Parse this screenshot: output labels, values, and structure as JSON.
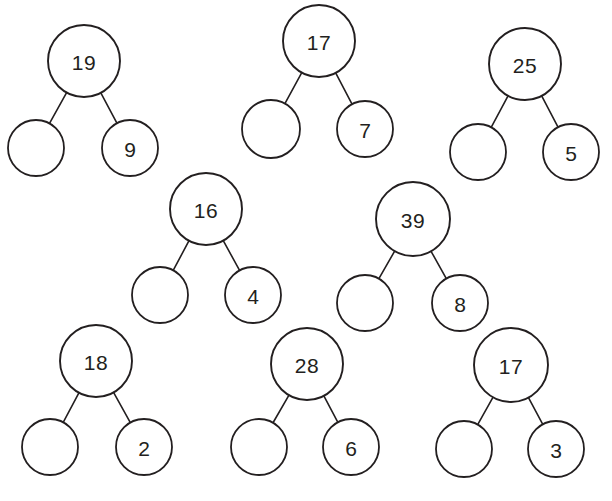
{
  "page": {
    "background_color": "#ffffff",
    "stroke_color": "#231f20",
    "text_color": "#231f20",
    "width": 612,
    "height": 501
  },
  "bonds": [
    {
      "id": "bond-1",
      "whole": "19",
      "left_part": "",
      "right_part": "9",
      "parent": {
        "cx": 84,
        "cy": 61,
        "r": 36
      },
      "left_child": {
        "cx": 36,
        "cy": 148,
        "r": 28
      },
      "right_child": {
        "cx": 130,
        "cy": 148,
        "r": 28
      }
    },
    {
      "id": "bond-2",
      "whole": "17",
      "left_part": "",
      "right_part": "7",
      "parent": {
        "cx": 319,
        "cy": 41,
        "r": 36
      },
      "left_child": {
        "cx": 271,
        "cy": 129,
        "r": 29
      },
      "right_child": {
        "cx": 365,
        "cy": 129,
        "r": 28
      }
    },
    {
      "id": "bond-3",
      "whole": "25",
      "left_part": "",
      "right_part": "5",
      "parent": {
        "cx": 525,
        "cy": 64,
        "r": 36
      },
      "left_child": {
        "cx": 478,
        "cy": 152,
        "r": 28
      },
      "right_child": {
        "cx": 571,
        "cy": 152,
        "r": 28
      }
    },
    {
      "id": "bond-4",
      "whole": "16",
      "left_part": "",
      "right_part": "4",
      "parent": {
        "cx": 206,
        "cy": 209,
        "r": 36
      },
      "left_child": {
        "cx": 160,
        "cy": 295,
        "r": 28
      },
      "right_child": {
        "cx": 253,
        "cy": 295,
        "r": 28
      }
    },
    {
      "id": "bond-5",
      "whole": "39",
      "left_part": "",
      "right_part": "8",
      "parent": {
        "cx": 413,
        "cy": 219,
        "r": 37
      },
      "left_child": {
        "cx": 365,
        "cy": 303,
        "r": 28
      },
      "right_child": {
        "cx": 460,
        "cy": 303,
        "r": 28
      }
    },
    {
      "id": "bond-6",
      "whole": "18",
      "left_part": "",
      "right_part": "2",
      "parent": {
        "cx": 96,
        "cy": 361,
        "r": 36
      },
      "left_child": {
        "cx": 50,
        "cy": 447,
        "r": 28
      },
      "right_child": {
        "cx": 144,
        "cy": 447,
        "r": 28
      }
    },
    {
      "id": "bond-7",
      "whole": "28",
      "left_part": "",
      "right_part": "6",
      "parent": {
        "cx": 307,
        "cy": 364,
        "r": 36
      },
      "left_child": {
        "cx": 259,
        "cy": 447,
        "r": 28
      },
      "right_child": {
        "cx": 351,
        "cy": 447,
        "r": 28
      }
    },
    {
      "id": "bond-8",
      "whole": "17",
      "left_part": "",
      "right_part": "3",
      "parent": {
        "cx": 511,
        "cy": 365,
        "r": 37
      },
      "left_child": {
        "cx": 464,
        "cy": 449,
        "r": 28
      },
      "right_child": {
        "cx": 556,
        "cy": 449,
        "r": 28
      }
    }
  ]
}
